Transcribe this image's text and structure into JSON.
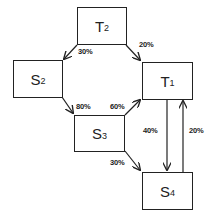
{
  "nodes": [
    {
      "id": "T2",
      "main": "T",
      "sub": "2"
    },
    {
      "id": "S2",
      "main": "S",
      "sub": "2"
    },
    {
      "id": "T1",
      "main": "T",
      "sub": "1"
    },
    {
      "id": "S3",
      "main": "S",
      "sub": "3"
    },
    {
      "id": "S4",
      "main": "S",
      "sub": "4"
    }
  ],
  "edges": [
    {
      "from": "T2",
      "to": "S2",
      "label": "30%"
    },
    {
      "from": "T2",
      "to": "T1",
      "label": "20%"
    },
    {
      "from": "S2",
      "to": "S3",
      "label": "80%"
    },
    {
      "from": "S3",
      "to": "T1",
      "label": "60%"
    },
    {
      "from": "S3",
      "to": "S4",
      "label": "30%"
    },
    {
      "from": "T1",
      "to": "S4",
      "label": "40%"
    },
    {
      "from": "S4",
      "to": "T1",
      "label": "20%"
    }
  ]
}
